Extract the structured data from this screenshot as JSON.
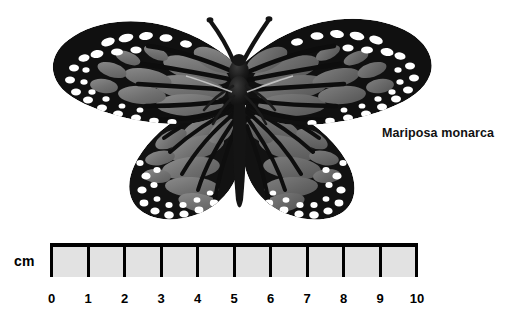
{
  "figure": {
    "background_color": "#ffffff",
    "specimen": {
      "common_name": "Mariposa monarca",
      "rendering": "grayscale photograph of a pinned monarch butterfly with wings spread",
      "colors": {
        "wing_black": "#111111",
        "wing_gray": "#6f6f6f",
        "wing_gray_light": "#8a8a8a",
        "wing_spot_white": "#ffffff",
        "body_black": "#141414"
      }
    },
    "caption": {
      "text": "Mariposa monarca"
    },
    "scale": {
      "unit_label": "cm",
      "min": 0,
      "max": 10,
      "ticks": [
        "0",
        "1",
        "2",
        "3",
        "4",
        "5",
        "6",
        "7",
        "8",
        "9",
        "10"
      ],
      "divisions": 10,
      "bar_fill_color": "#e2e2e2",
      "bar_line_color": "#000000"
    }
  }
}
